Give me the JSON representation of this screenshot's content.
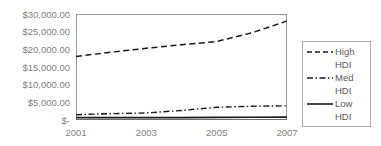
{
  "chart_data": {
    "type": "line",
    "title": "",
    "xlabel": "",
    "ylabel": "",
    "x": [
      2001,
      2002,
      2003,
      2004,
      2005,
      2006,
      2007
    ],
    "xlim": [
      2001,
      2007
    ],
    "ylim": [
      0,
      30000
    ],
    "grid": false,
    "legend_position": "right",
    "y_tick_labels": [
      "$30,000.00",
      "$25,000.00",
      "$20,000.00",
      "$15,000.00",
      "$10,000.00",
      "$5,000.00",
      "$-"
    ],
    "y_tick_values": [
      30000,
      25000,
      20000,
      15000,
      10000,
      5000,
      0
    ],
    "x_tick_labels": [
      "2001",
      "2003",
      "2005",
      "2007"
    ],
    "x_tick_values": [
      2001,
      2003,
      2005,
      2007
    ],
    "series": [
      {
        "name": "High HDI",
        "style": "dashed",
        "color": "#1a1a1a",
        "values": [
          18000,
          19200,
          20300,
          21300,
          22200,
          24700,
          28000
        ]
      },
      {
        "name": "Med HDI",
        "style": "dash-dot",
        "color": "#1a1a1a",
        "values": [
          1500,
          1800,
          2000,
          2700,
          3600,
          3900,
          4000
        ]
      },
      {
        "name": "Low HDI",
        "style": "solid",
        "color": "#1a1a1a",
        "values": [
          700,
          700,
          700,
          700,
          750,
          780,
          800
        ]
      }
    ]
  },
  "legend": {
    "entries": [
      {
        "label_line1": "High",
        "label_line2": "HDI",
        "style": "dashed"
      },
      {
        "label_line1": "Med",
        "label_line2": "HDI",
        "style": "dash-dot"
      },
      {
        "label_line1": "Low",
        "label_line2": "HDI",
        "style": "solid"
      }
    ]
  },
  "colors": {
    "axis": "#9a9a9a",
    "tick_text": "#808080",
    "legend_text": "#595959",
    "series_line": "#1a1a1a",
    "legend_border": "#b0b0b0",
    "background": "#ffffff"
  }
}
